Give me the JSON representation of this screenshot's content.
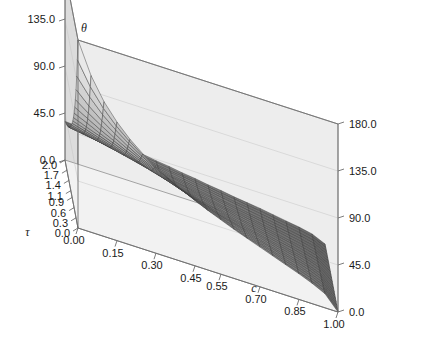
{
  "figure": {
    "kind": "3d-surface-plot",
    "background_color": "#ffffff",
    "left_panel_color": "#dcdcdc",
    "right_panel_color": "#ededed",
    "floor_color": "#f2f2f2",
    "axis_line_color": "#6e6e6e",
    "mesh_line_color": "#3a3a3a",
    "surface_low_color": "#5e5e5e",
    "surface_high_color": "#fafafa"
  },
  "axes": {
    "z": {
      "title": "θ",
      "ticks": [
        "0.0",
        "45.0",
        "90.0",
        "135.0",
        "180.0"
      ],
      "values": [
        0,
        45,
        90,
        135,
        180
      ],
      "range": [
        0,
        180
      ]
    },
    "tau": {
      "title": "τ",
      "ticks": [
        "0.0",
        "0.3",
        "0.6",
        "0.9",
        "1.1",
        "1.4",
        "1.7",
        "2.0"
      ],
      "values": [
        0.0,
        0.3,
        0.6,
        0.9,
        1.1,
        1.4,
        1.7,
        2.0
      ],
      "range": [
        0,
        2.0
      ]
    },
    "c": {
      "title": "c",
      "ticks": [
        "0.00",
        "0.15",
        "0.30",
        "0.45",
        "0.55",
        "0.70",
        "0.85",
        "1.00"
      ],
      "values": [
        0.0,
        0.15,
        0.3,
        0.45,
        0.55,
        0.7,
        0.85,
        1.0
      ],
      "range": [
        0,
        1.0
      ]
    }
  },
  "chart_data": {
    "type": "surface",
    "title": "θ",
    "xlabel": "c",
    "ylabel": "τ",
    "zlabel": "θ",
    "xlim": [
      0,
      1.0
    ],
    "ylim": [
      0,
      2.0
    ],
    "zlim": [
      0,
      180
    ],
    "grid": true,
    "legend": "none",
    "mesh_nx": 21,
    "mesh_ny": 21,
    "x": [
      0.0,
      0.05,
      0.1,
      0.15,
      0.2,
      0.25,
      0.3,
      0.35,
      0.4,
      0.45,
      0.5,
      0.55,
      0.6,
      0.65,
      0.7,
      0.75,
      0.8,
      0.85,
      0.9,
      0.95,
      1.0
    ],
    "y": [
      0.0,
      0.1,
      0.2,
      0.3,
      0.4,
      0.5,
      0.6,
      0.7,
      0.8,
      0.9,
      1.0,
      1.1,
      1.2,
      1.3,
      1.4,
      1.5,
      1.6,
      1.7,
      1.8,
      1.9,
      2.0
    ],
    "z_rows": [
      [
        180.0,
        150.0,
        129.0,
        113.5,
        101.0,
        91.0,
        82.5,
        75.0,
        68.5,
        62.5,
        57.0,
        52.0,
        47.0,
        42.5,
        38.0,
        33.5,
        29.0,
        24.5,
        19.5,
        13.5,
        0.0
      ],
      [
        158.0,
        136.0,
        119.5,
        106.5,
        96.0,
        87.0,
        79.0,
        72.0,
        65.5,
        60.0,
        54.5,
        50.0,
        45.0,
        40.5,
        36.5,
        32.0,
        27.5,
        23.0,
        18.5,
        13.0,
        0.0
      ],
      [
        139.0,
        123.0,
        110.0,
        99.5,
        90.5,
        82.5,
        75.5,
        69.0,
        63.0,
        57.5,
        52.5,
        48.0,
        43.5,
        39.0,
        35.0,
        31.0,
        26.5,
        22.5,
        18.0,
        12.5,
        0.0
      ],
      [
        123.0,
        111.0,
        101.0,
        92.5,
        84.5,
        77.5,
        71.5,
        65.5,
        60.0,
        55.0,
        50.0,
        46.0,
        41.5,
        37.5,
        33.5,
        29.5,
        25.5,
        21.5,
        17.5,
        12.0,
        0.0
      ],
      [
        110.0,
        101.0,
        93.0,
        85.5,
        79.0,
        73.0,
        67.5,
        62.0,
        57.0,
        52.5,
        48.0,
        44.0,
        40.0,
        36.0,
        32.0,
        28.5,
        24.5,
        21.0,
        16.5,
        11.5,
        0.0
      ],
      [
        99.5,
        92.5,
        85.5,
        79.5,
        73.5,
        68.5,
        63.5,
        58.5,
        54.0,
        49.5,
        45.5,
        41.5,
        38.0,
        34.5,
        30.5,
        27.0,
        23.5,
        20.0,
        16.0,
        11.0,
        0.0
      ],
      [
        90.5,
        85.0,
        79.0,
        74.0,
        69.0,
        64.0,
        59.5,
        55.5,
        51.0,
        47.0,
        43.5,
        39.5,
        36.0,
        32.5,
        29.5,
        26.0,
        22.5,
        19.0,
        15.5,
        10.5,
        0.0
      ],
      [
        83.0,
        78.0,
        73.5,
        69.0,
        64.5,
        60.5,
        56.5,
        52.5,
        48.5,
        45.0,
        41.0,
        37.5,
        34.5,
        31.0,
        28.0,
        25.0,
        21.5,
        18.5,
        14.5,
        10.0,
        0.0
      ],
      [
        76.5,
        72.5,
        68.5,
        64.5,
        60.5,
        57.0,
        53.0,
        49.5,
        46.0,
        42.5,
        39.0,
        36.0,
        32.5,
        29.5,
        26.5,
        23.5,
        20.5,
        17.5,
        14.0,
        9.8,
        0.0
      ],
      [
        71.0,
        67.5,
        64.0,
        60.5,
        57.0,
        53.5,
        50.5,
        47.0,
        43.5,
        40.5,
        37.0,
        34.0,
        31.0,
        28.0,
        25.5,
        22.5,
        19.5,
        16.5,
        13.5,
        9.3,
        0.0
      ],
      [
        66.0,
        63.0,
        60.0,
        56.5,
        53.5,
        50.5,
        47.5,
        44.5,
        41.5,
        38.5,
        35.5,
        32.5,
        29.5,
        27.0,
        24.0,
        21.5,
        18.5,
        16.0,
        12.5,
        8.8,
        0.0
      ],
      [
        61.5,
        59.0,
        56.0,
        53.5,
        50.5,
        48.0,
        45.0,
        42.0,
        39.5,
        36.5,
        34.0,
        31.0,
        28.5,
        25.5,
        23.0,
        20.5,
        18.0,
        15.0,
        12.0,
        8.4,
        0.0
      ],
      [
        57.5,
        55.5,
        53.0,
        50.5,
        48.0,
        45.5,
        42.5,
        40.0,
        37.5,
        35.0,
        32.0,
        29.5,
        27.0,
        24.5,
        22.0,
        19.5,
        17.0,
        14.5,
        11.5,
        8.0,
        0.0
      ],
      [
        54.0,
        52.0,
        50.0,
        47.5,
        45.5,
        43.0,
        40.5,
        38.0,
        35.5,
        33.0,
        30.5,
        28.0,
        25.5,
        23.5,
        21.0,
        18.5,
        16.0,
        13.5,
        11.0,
        7.6,
        0.0
      ],
      [
        51.0,
        49.0,
        47.0,
        45.0,
        43.0,
        41.0,
        38.5,
        36.0,
        34.0,
        31.5,
        29.0,
        27.0,
        24.5,
        22.0,
        20.0,
        17.5,
        15.5,
        13.0,
        10.5,
        7.2,
        0.0
      ],
      [
        48.0,
        46.5,
        44.5,
        42.5,
        40.5,
        38.5,
        36.5,
        34.5,
        32.0,
        30.0,
        27.5,
        25.5,
        23.5,
        21.0,
        19.0,
        17.0,
        14.5,
        12.5,
        10.0,
        6.9,
        0.0
      ],
      [
        45.5,
        44.0,
        42.5,
        40.5,
        38.5,
        37.0,
        35.0,
        33.0,
        30.5,
        28.5,
        26.5,
        24.5,
        22.0,
        20.0,
        18.0,
        16.0,
        14.0,
        12.0,
        9.5,
        6.6,
        0.0
      ],
      [
        43.0,
        41.5,
        40.0,
        38.5,
        37.0,
        35.0,
        33.5,
        31.5,
        29.5,
        27.5,
        25.5,
        23.5,
        21.5,
        19.5,
        17.5,
        15.5,
        13.5,
        11.5,
        9.2,
        6.3,
        0.0
      ],
      [
        41.0,
        39.5,
        38.5,
        37.0,
        35.5,
        33.5,
        32.0,
        30.0,
        28.0,
        26.5,
        24.5,
        22.5,
        20.5,
        18.5,
        17.0,
        15.0,
        13.0,
        11.0,
        8.8,
        6.1,
        0.0
      ],
      [
        39.0,
        38.0,
        36.5,
        35.0,
        33.5,
        32.0,
        30.5,
        29.0,
        27.0,
        25.0,
        23.5,
        21.5,
        19.5,
        18.0,
        16.0,
        14.5,
        12.5,
        10.5,
        8.5,
        5.8,
        0.0
      ],
      [
        37.0,
        36.0,
        35.0,
        33.5,
        32.0,
        31.0,
        29.5,
        27.5,
        26.0,
        24.0,
        22.5,
        20.5,
        19.0,
        17.0,
        15.5,
        14.0,
        12.0,
        10.0,
        8.2,
        5.6,
        0.0
      ]
    ]
  },
  "projection": {
    "origin": {
      "x": 78,
      "y": 228
    },
    "c_axis_vec": {
      "x": 260,
      "y": 84
    },
    "tau_axis_vec": {
      "x": -13,
      "y": -68
    },
    "z_axis_height": 188
  }
}
